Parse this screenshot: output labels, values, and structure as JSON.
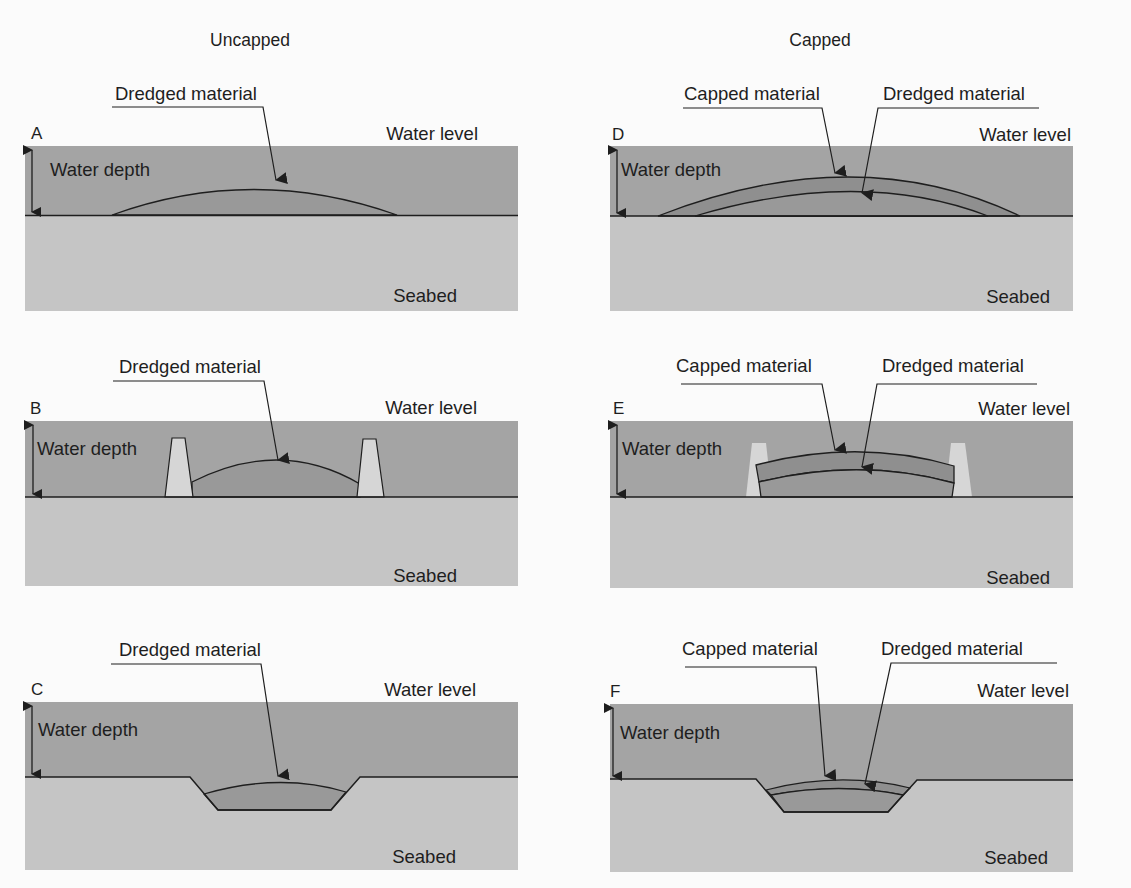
{
  "columns": {
    "left": {
      "title": "Uncapped"
    },
    "right": {
      "title": "Capped"
    }
  },
  "labels": {
    "water_level": "Water level",
    "water_depth": "Water depth",
    "seabed": "Seabed",
    "dredged_material": "Dredged material",
    "capped_material": "Capped material"
  },
  "panels": [
    {
      "id": "A",
      "letter": "A",
      "column": "Uncapped",
      "type": "flat seabed, open mound",
      "callouts": [
        "Dredged material"
      ]
    },
    {
      "id": "B",
      "letter": "B",
      "column": "Uncapped",
      "type": "flat seabed, contained by dikes",
      "callouts": [
        "Dredged material"
      ]
    },
    {
      "id": "C",
      "letter": "C",
      "column": "Uncapped",
      "type": "depression / pit fill",
      "callouts": [
        "Dredged material"
      ]
    },
    {
      "id": "D",
      "letter": "D",
      "column": "Capped",
      "type": "flat seabed, capped mound",
      "callouts": [
        "Capped material",
        "Dredged material"
      ]
    },
    {
      "id": "E",
      "letter": "E",
      "column": "Capped",
      "type": "flat seabed, capped, contained by dikes",
      "callouts": [
        "Capped material",
        "Dredged material"
      ]
    },
    {
      "id": "F",
      "letter": "F",
      "column": "Capped",
      "type": "depression / pit fill, capped",
      "callouts": [
        "Capped material",
        "Dredged material"
      ]
    }
  ],
  "colors": {
    "background": "#fbfbfb",
    "water": "#a4a4a4",
    "seabed": "#c5c5c5",
    "dredged_material": "#999999",
    "capped_material": "#8f8f8f",
    "dike": "#d6d6d6",
    "line": "#1e1e1e"
  }
}
